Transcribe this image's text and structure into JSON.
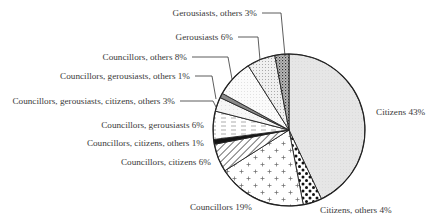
{
  "chart_data": {
    "type": "pie",
    "title": "",
    "start_angle_deg": 0,
    "direction": "clockwise",
    "center": [
      289,
      130
    ],
    "radius": 76,
    "slices": [
      {
        "label": "Citizens",
        "value": 43,
        "display": "Citizens 43%",
        "pattern": "lightgray"
      },
      {
        "label": "Citizens, others",
        "value": 4,
        "display": "Citizens, others 4%",
        "pattern": "bigdots"
      },
      {
        "label": "Councillors",
        "value": 19,
        "display": "Councillors 19%",
        "pattern": "plus"
      },
      {
        "label": "Councillors, citizens",
        "value": 6,
        "display": "Councillors, citizens 6%",
        "pattern": "hatch"
      },
      {
        "label": "Councillors, citizens, others",
        "value": 1,
        "display": "Councillors, citizens, others 1%",
        "pattern": "black"
      },
      {
        "label": "Councillors, gerousiasts",
        "value": 6,
        "display": "Councillors, gerousiasts 6%",
        "pattern": "dashes"
      },
      {
        "label": "Councillors, gerousiasts, citizens, others",
        "value": 3,
        "display": "Councillors, gerousiasts, citizens, others 3%",
        "pattern": "faint"
      },
      {
        "label": "Councillors, gerousiasts, others",
        "value": 1,
        "display": "Councillors, gerousiasts, others 1%",
        "pattern": "gray"
      },
      {
        "label": "Councillors, others",
        "value": 8,
        "display": "Councillors, others 8%",
        "pattern": "finedots"
      },
      {
        "label": "Gerousiasts",
        "value": 6,
        "display": "Gerousiasts 6%",
        "pattern": "dots"
      },
      {
        "label": "Gerousiasts, others",
        "value": 3,
        "display": "Gerousiasts, others 3%",
        "pattern": "cross"
      }
    ],
    "labels_layout": [
      {
        "x": 376,
        "y": 115,
        "anchor": "start",
        "leader": null
      },
      {
        "x": 320,
        "y": 213,
        "anchor": "start",
        "leader": null
      },
      {
        "x": 252,
        "y": 210,
        "anchor": "end",
        "leader": null
      },
      {
        "x": 211,
        "y": 165,
        "anchor": "end",
        "leader": null
      },
      {
        "x": 204,
        "y": 146,
        "anchor": "end",
        "leader": null
      },
      {
        "x": 204,
        "y": 128,
        "anchor": "end",
        "leader": null
      },
      {
        "x": 175,
        "y": 104,
        "anchor": "end",
        "leader": [
          [
            180,
            101
          ],
          [
            213,
            101
          ],
          [
            216,
            107
          ]
        ]
      },
      {
        "x": 190,
        "y": 79,
        "anchor": "end",
        "leader": [
          [
            195,
            76
          ],
          [
            212,
            76
          ],
          [
            216,
            99
          ]
        ]
      },
      {
        "x": 187,
        "y": 60,
        "anchor": "end",
        "leader": [
          [
            192,
            57
          ],
          [
            228,
            57
          ],
          [
            232,
            79
          ]
        ]
      },
      {
        "x": 233,
        "y": 40,
        "anchor": "end",
        "leader": [
          [
            238,
            37
          ],
          [
            258,
            37
          ],
          [
            260,
            60
          ]
        ]
      },
      {
        "x": 257,
        "y": 16,
        "anchor": "end",
        "leader": [
          [
            262,
            13
          ],
          [
            281,
            13
          ],
          [
            285,
            56
          ]
        ]
      }
    ],
    "xlabel": "",
    "ylabel": "",
    "legend": "none"
  }
}
